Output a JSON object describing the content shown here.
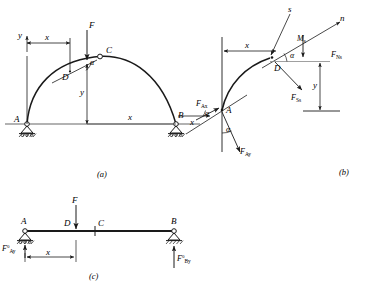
{
  "figure": {
    "stroke_color": "#1a1a1a",
    "ground_color": "#555555"
  },
  "captions": {
    "a": "(a)",
    "b": "(b)",
    "c": "(c)"
  },
  "panel_a": {
    "name": "three-hinged arch with load F",
    "points": {
      "A": "A",
      "B": "B",
      "C": "C",
      "D": "D"
    },
    "axes": {
      "y": "y",
      "x_top": "x",
      "x_bottom": "x",
      "y_rise": "y"
    },
    "load": "F",
    "angle": "α",
    "supports": {
      "left": "pinned-hatched-support",
      "right": "pinned-hatched-support"
    }
  },
  "panel_b": {
    "name": "cut section free body at D",
    "points": {
      "A": "A",
      "D": "D"
    },
    "axes": {
      "s": "s",
      "n": "n",
      "x_dim": "x",
      "x_arrow": "x",
      "y_dim": "y"
    },
    "angles": {
      "at_D": "α",
      "at_A_upper": "α",
      "at_A_lower": "α"
    },
    "forces": {
      "normal": {
        "base": "F",
        "sub": "Ns"
      },
      "shear": {
        "base": "F",
        "sub": "Ss"
      },
      "reaction_x": {
        "base": "F",
        "sub": "Ax"
      },
      "reaction_y": {
        "base": "F",
        "sub": "Ay"
      }
    },
    "moment": {
      "base": "M",
      "sub": "s"
    }
  },
  "panel_c": {
    "name": "equivalent simply supported beam",
    "points": {
      "A": "A",
      "B": "B",
      "C": "C",
      "D": "D"
    },
    "load": "F",
    "dimension": "x",
    "reactions": {
      "left": {
        "base": "F",
        "sup": "0",
        "sub": "Ay"
      },
      "right": {
        "base": "F",
        "sup": "0",
        "sub": "By"
      }
    },
    "supports": {
      "left": "pin-hatched-support",
      "right": "roller-hatched-support"
    }
  }
}
